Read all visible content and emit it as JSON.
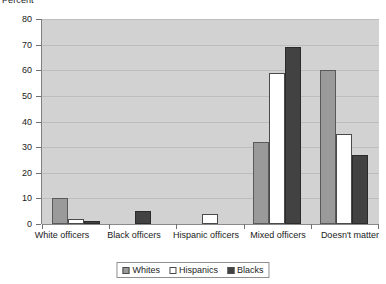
{
  "chart_data": {
    "type": "bar",
    "title": "",
    "ylabel": "Percent",
    "xlabel": "",
    "ylim": [
      0,
      80
    ],
    "ytick_step": 10,
    "yticks": [
      "0",
      "10",
      "20",
      "30",
      "40",
      "50",
      "60",
      "70",
      "80"
    ],
    "grid": true,
    "legend_position": "bottom-center",
    "categories": [
      "White officers",
      "Black officers",
      "Hispanic officers",
      "Mixed officers",
      "Doesn't matter"
    ],
    "series": [
      {
        "name": "Whites",
        "color": "#9a9a9a",
        "values": [
          10,
          0,
          0,
          32,
          60
        ]
      },
      {
        "name": "Hispanics",
        "color": "#ffffff",
        "values": [
          2,
          0,
          4,
          59,
          35
        ]
      },
      {
        "name": "Blacks",
        "color": "#424242",
        "values": [
          1,
          5,
          0,
          69,
          27
        ]
      }
    ]
  },
  "plot": {
    "background_color": "#d2d2d2",
    "gridline_color": "#bdbdbd",
    "axis_color": "#808080"
  }
}
